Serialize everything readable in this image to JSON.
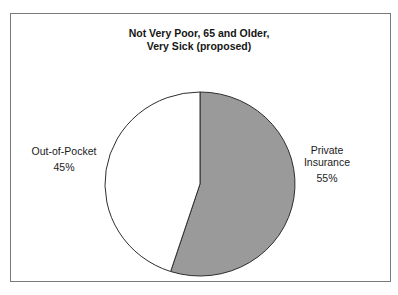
{
  "chart": {
    "frame_border_color": "#7a7a7a",
    "background_color": "#ffffff"
  },
  "chart_data": {
    "type": "pie",
    "title": "Not Very Poor, 65 and Older, Very Sick (proposed)",
    "title_lines": [
      "Not Very Poor, 65 and Older,",
      "Very Sick (proposed)"
    ],
    "start_angle_deg": 0,
    "direction": "clockwise",
    "outline_color": "#2e2e2e",
    "legend_position": "side-labels",
    "slices": [
      {
        "label": "Private Insurance",
        "label_lines": [
          "Private",
          "Insurance"
        ],
        "value": 55,
        "pct_label": "55%",
        "color": "#9a9a9a",
        "label_side": "right"
      },
      {
        "label": "Out-of-Pocket",
        "label_lines": [
          "Out-of-Pocket"
        ],
        "value": 45,
        "pct_label": "45%",
        "color": "#ffffff",
        "label_side": "left"
      }
    ]
  }
}
